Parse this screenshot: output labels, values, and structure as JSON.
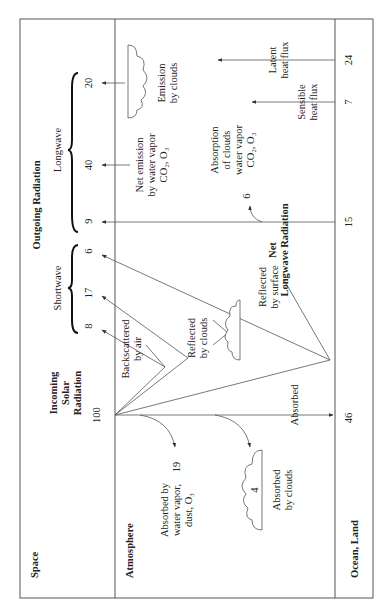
{
  "regions": {
    "space": "Space",
    "atmosphere": "Atmosphere",
    "surface": "Ocean, Land"
  },
  "incoming": {
    "label_line1": "Incoming",
    "label_line2": "Solar",
    "label_line3": "Radiation",
    "value": "100"
  },
  "outgoing": {
    "title": "Outgoing Radiation",
    "shortwave_label": "Shortwave",
    "longwave_label": "Longwave",
    "shortwave_values": [
      "8",
      "17",
      "6"
    ],
    "longwave_values": [
      "9",
      "40",
      "20"
    ]
  },
  "shortwave_paths": {
    "backscattered_line1": "Backscattered",
    "backscattered_line2": "by air",
    "reflected_clouds_line1": "Reflected",
    "reflected_clouds_line2": "by clouds",
    "reflected_surface_line1": "Reflected",
    "reflected_surface_line2": "by surface"
  },
  "absorption": {
    "water_vapor_line1": "Absorbed by",
    "water_vapor_line2": "water vapor,",
    "water_vapor_line3": "dust, O₃",
    "water_vapor_value": "19",
    "clouds_line1": "Absorbed",
    "clouds_line2": "by clouds",
    "clouds_value": "4",
    "surface_label": "Absorbed",
    "surface_value": "46"
  },
  "longwave_paths": {
    "net_emission_line1": "Net emission",
    "net_emission_line2": "by water vapor",
    "net_emission_line3": "CO₂, O₃",
    "emission_clouds_line1": "Emission",
    "emission_clouds_line2": "by clouds",
    "absorption_line1": "Absorption",
    "absorption_line2": "of clouds",
    "absorption_line3": "water vapor",
    "absorption_line4": "CO₂, O₃",
    "absorption_value": "6",
    "net_longwave_line1": "Net",
    "net_longwave_line2": "Longwave Radiation",
    "net_longwave_value": "15"
  },
  "heat_flux": {
    "sensible_line1": "Sensible",
    "sensible_line2": "heat flux",
    "sensible_value": "7",
    "latent_line1": "Latent",
    "latent_line2": "heat flux",
    "latent_value": "24"
  },
  "colors": {
    "line": "#555555",
    "text": "#222222",
    "background": "#ffffff"
  }
}
